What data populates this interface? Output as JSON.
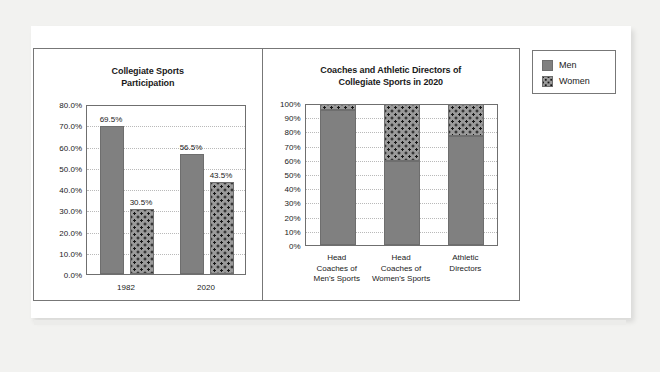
{
  "legend": {
    "items": [
      {
        "label": "Men",
        "icon": "solid-gray-swatch-icon",
        "color": "#808080"
      },
      {
        "label": "Women",
        "icon": "dotted-gray-swatch-icon",
        "color": "#9a9a9a"
      }
    ]
  },
  "chart_data": [
    {
      "id": "collegiate-sports-participation",
      "type": "bar",
      "title": "Collegiate Sports\nParticipation",
      "title_line1": "Collegiate Sports",
      "title_line2": "Participation",
      "xlabel": "",
      "ylabel": "",
      "ylim": [
        0,
        80
      ],
      "grid": true,
      "legend_position": "outside-right",
      "categories": [
        "1982",
        "2020"
      ],
      "yticks": [
        "0.0%",
        "10.0%",
        "20.0%",
        "30.0%",
        "40.0%",
        "50.0%",
        "60.0%",
        "70.0%",
        "80.0%"
      ],
      "series": [
        {
          "name": "Men",
          "values": [
            69.5,
            30.5
          ],
          "labels": [
            "69.5%",
            "56.5%"
          ]
        },
        {
          "name": "Women",
          "values": [
            30.5,
            43.5
          ],
          "labels": [
            "30.5%",
            "43.5%"
          ]
        }
      ],
      "bars": [
        {
          "category": "1982",
          "series": "Men",
          "value": 69.5,
          "label": "69.5%"
        },
        {
          "category": "1982",
          "series": "Women",
          "value": 30.5,
          "label": "30.5%"
        },
        {
          "category": "2020",
          "series": "Men",
          "value": 56.5,
          "label": "56.5%"
        },
        {
          "category": "2020",
          "series": "Women",
          "value": 43.5,
          "label": "43.5%"
        }
      ]
    },
    {
      "id": "coaches-and-athletic-directors",
      "type": "bar",
      "title": "Coaches and Athletic Directors of\nCollegiate Sports in 2020",
      "title_line1": "Coaches and Athletic Directors of",
      "title_line2": "Collegiate Sports in 2020",
      "stacked": true,
      "xlabel": "",
      "ylabel": "",
      "ylim": [
        0,
        100
      ],
      "grid": true,
      "legend_position": "outside-right",
      "categories": [
        "Head Coaches of Men's Sports",
        "Head Coaches of Women's Sports",
        "Athletic Directors"
      ],
      "category_lines": [
        [
          "Head",
          "Coaches of",
          "Men's Sports"
        ],
        [
          "Head",
          "Coaches of",
          "Women's Sports"
        ],
        [
          "Athletic",
          "Directors"
        ]
      ],
      "yticks": [
        "0%",
        "10%",
        "20%",
        "30%",
        "40%",
        "50%",
        "60%",
        "70%",
        "80%",
        "90%",
        "100%"
      ],
      "series": [
        {
          "name": "Men",
          "values": [
            95,
            59,
            77
          ]
        },
        {
          "name": "Women",
          "values": [
            5,
            41,
            23
          ]
        }
      ]
    }
  ]
}
